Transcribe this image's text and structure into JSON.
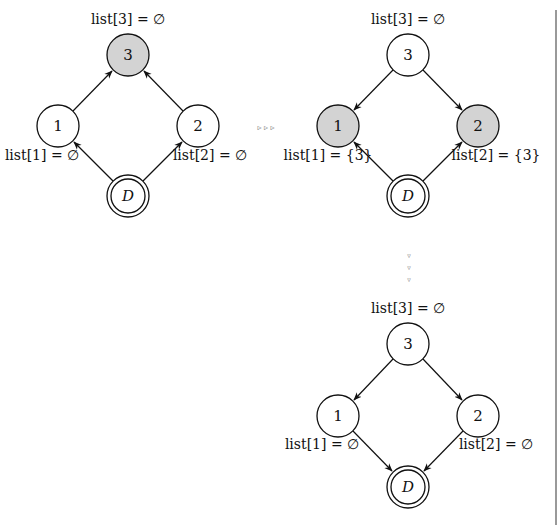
{
  "colors": {
    "highlight_fill": "#d3d3d3",
    "node_fill": "#ffffff",
    "stroke": "#111111",
    "frame_line": "#777777"
  },
  "diagrams": [
    {
      "id": "initial",
      "nodes": [
        {
          "id": "3",
          "label": "3",
          "highlighted": true,
          "list_label": "list[3] = ∅"
        },
        {
          "id": "1",
          "label": "1",
          "highlighted": false,
          "list_label": "list[1] = ∅"
        },
        {
          "id": "2",
          "label": "2",
          "highlighted": false,
          "list_label": "list[2] = ∅"
        },
        {
          "id": "D",
          "label": "D",
          "highlighted": false,
          "double": true
        }
      ],
      "edges": [
        {
          "from": "1",
          "to": "3"
        },
        {
          "from": "2",
          "to": "3"
        },
        {
          "from": "D",
          "to": "1"
        },
        {
          "from": "D",
          "to": "2"
        }
      ]
    },
    {
      "id": "after-reverse",
      "nodes": [
        {
          "id": "3",
          "label": "3",
          "highlighted": false,
          "list_label": "list[3] = ∅"
        },
        {
          "id": "1",
          "label": "1",
          "highlighted": true,
          "list_label": "list[1] = {3}"
        },
        {
          "id": "2",
          "label": "2",
          "highlighted": true,
          "list_label": "list[2] = {3}"
        },
        {
          "id": "D",
          "label": "D",
          "highlighted": false,
          "double": true
        }
      ],
      "edges": [
        {
          "from": "3",
          "to": "1"
        },
        {
          "from": "3",
          "to": "2"
        },
        {
          "from": "D",
          "to": "1"
        },
        {
          "from": "D",
          "to": "2"
        }
      ]
    },
    {
      "id": "final",
      "nodes": [
        {
          "id": "3",
          "label": "3",
          "highlighted": false,
          "list_label": "list[3] = ∅"
        },
        {
          "id": "1",
          "label": "1",
          "highlighted": false,
          "list_label": "list[1] = ∅"
        },
        {
          "id": "2",
          "label": "2",
          "highlighted": false,
          "list_label": "list[2] = ∅"
        },
        {
          "id": "D",
          "label": "D",
          "highlighted": false,
          "double": true
        }
      ],
      "edges": [
        {
          "from": "3",
          "to": "1"
        },
        {
          "from": "3",
          "to": "2"
        },
        {
          "from": "1",
          "to": "D"
        },
        {
          "from": "2",
          "to": "D"
        }
      ]
    }
  ],
  "transitions": [
    {
      "from": "initial",
      "to": "after-reverse",
      "direction": "right",
      "glyph": "▹ ▹ ▹"
    },
    {
      "from": "after-reverse",
      "to": "final",
      "direction": "down",
      "glyph": "▿ ▿ ▿"
    }
  ]
}
